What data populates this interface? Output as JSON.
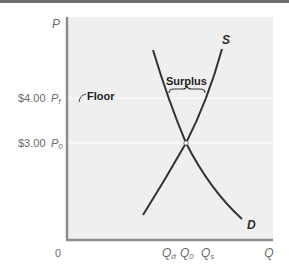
{
  "diagram": {
    "colors": {
      "plot_background": "#efefef",
      "axis": "#8c8c8c",
      "gridline": "#ffffff",
      "curve": "#333333",
      "label": "#6a6a6a",
      "top_bar": "#6d6e70"
    },
    "axes": {
      "y_label": "P",
      "x_label": "Q",
      "origin_label": "0"
    },
    "y_ticks": [
      {
        "price": "$4.00",
        "symbol": "P",
        "subscript": "f"
      },
      {
        "price": "$3.00",
        "symbol": "P",
        "subscript": "0"
      }
    ],
    "x_ticks": [
      {
        "symbol": "Q",
        "subscript": "d"
      },
      {
        "symbol": "Q",
        "subscript": "0"
      },
      {
        "symbol": "Q",
        "subscript": "s"
      }
    ],
    "curves": {
      "supply_label": "S",
      "demand_label": "D"
    },
    "annotations": {
      "floor": "Floor",
      "surplus": "Surplus"
    }
  }
}
